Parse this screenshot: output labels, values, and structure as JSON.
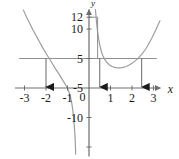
{
  "figure": {
    "name": "coordinate-graph",
    "background": "#ffffff",
    "curve_color": "#9a9a9a",
    "axis_color": "#6e6e6e",
    "line_color": "#8f8f8f",
    "arrow_color": "#1a1a1a",
    "text_color": "#1a1a1a"
  },
  "axes": {
    "x_axis_label": "x",
    "y_axis_label": "y",
    "x_ticks": [
      "-3",
      "-2",
      "-1",
      "1",
      "2",
      "3"
    ],
    "y_ticks": [
      "12",
      "10",
      "5",
      "-5",
      "-10"
    ],
    "origin_label": "0"
  },
  "chart_data": {
    "type": "line",
    "title": "",
    "xlabel": "x",
    "ylabel": "y",
    "xlim": [
      -3.4,
      3.4
    ],
    "ylim": [
      -11.5,
      13.5
    ],
    "grid": false,
    "legend": "none",
    "x_tick_values": [
      -3,
      -2,
      -1,
      0,
      1,
      2,
      3
    ],
    "x_tick_labels": [
      "-3",
      "-2",
      "-1",
      "0",
      "1",
      "2",
      "3"
    ],
    "y_tick_values": [
      12,
      10,
      5,
      0,
      -5,
      -10
    ],
    "y_tick_labels": [
      "12",
      "10",
      "5",
      "-5",
      "-10"
    ],
    "series": [
      {
        "name": "curve-left-branch",
        "type": "line",
        "points": [
          [
            -3.05,
            13.2
          ],
          [
            -2.9,
            12.0
          ],
          [
            -2.75,
            10.9
          ],
          [
            -2.6,
            9.8
          ],
          [
            -2.45,
            8.8
          ],
          [
            -2.3,
            7.8
          ],
          [
            -2.15,
            6.8
          ],
          [
            -2.0,
            5.9
          ],
          [
            -1.85,
            5.0
          ],
          [
            -1.7,
            4.1
          ],
          [
            -1.55,
            3.2
          ],
          [
            -1.4,
            2.4
          ],
          [
            -1.25,
            1.5
          ],
          [
            -1.1,
            0.6
          ],
          [
            -1.0,
            0.0
          ],
          [
            -0.92,
            -0.8
          ],
          [
            -0.85,
            -1.7
          ],
          [
            -0.8,
            -2.6
          ],
          [
            -0.76,
            -3.6
          ],
          [
            -0.73,
            -4.6
          ],
          [
            -0.7,
            -5.7
          ],
          [
            -0.675,
            -6.8
          ],
          [
            -0.655,
            -7.9
          ],
          [
            -0.64,
            -9.0
          ],
          [
            -0.63,
            -10.0
          ],
          [
            -0.62,
            -11.2
          ]
        ]
      },
      {
        "name": "curve-right-branch",
        "type": "line",
        "points": [
          [
            0.3,
            13.3
          ],
          [
            0.33,
            12.0
          ],
          [
            0.36,
            10.8
          ],
          [
            0.4,
            9.5
          ],
          [
            0.45,
            8.3
          ],
          [
            0.5,
            7.3
          ],
          [
            0.56,
            6.4
          ],
          [
            0.63,
            5.6
          ],
          [
            0.72,
            4.9
          ],
          [
            0.82,
            4.4
          ],
          [
            0.95,
            3.9
          ],
          [
            1.1,
            3.6
          ],
          [
            1.25,
            3.45
          ],
          [
            1.4,
            3.4
          ],
          [
            1.55,
            3.45
          ],
          [
            1.7,
            3.6
          ],
          [
            1.85,
            3.85
          ],
          [
            2.0,
            4.2
          ],
          [
            2.15,
            4.6
          ],
          [
            2.3,
            5.1
          ],
          [
            2.45,
            5.7
          ],
          [
            2.6,
            6.4
          ],
          [
            2.75,
            7.3
          ],
          [
            2.9,
            8.3
          ],
          [
            3.05,
            9.4
          ],
          [
            3.2,
            10.6
          ],
          [
            3.3,
            11.4
          ]
        ]
      },
      {
        "name": "horizontal-line-y5",
        "type": "line",
        "y_value": 5,
        "x_from": -3.25,
        "x_to": 3.15
      },
      {
        "name": "segment-y12",
        "type": "line",
        "y_value": 12,
        "x_from": 0.0,
        "x_to": 0.4
      }
    ],
    "annotations": [
      {
        "name": "drop-arrow-1",
        "x": -2.0,
        "y_from": 5,
        "y_to": 0,
        "label": ""
      },
      {
        "name": "drop-arrow-2",
        "x": 0.5,
        "y_from": 5,
        "y_to": 0,
        "label": ""
      },
      {
        "name": "drop-arrow-3",
        "x": 2.45,
        "y_from": 5,
        "y_to": 0,
        "label": ""
      },
      {
        "name": "vertical-drop-12",
        "x": 0.4,
        "y_from": 12,
        "y_to": 5,
        "label": ""
      }
    ]
  }
}
